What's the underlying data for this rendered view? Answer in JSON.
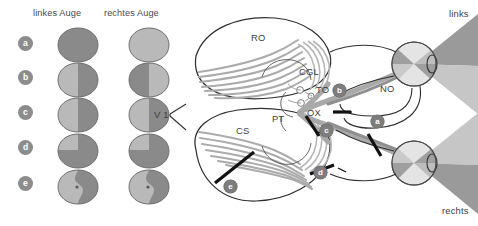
{
  "figure": {
    "side_labels": {
      "top": "links",
      "bottom": "rechts"
    }
  },
  "fields_panel": {
    "headers": {
      "left_eye": "linkes Auge",
      "right_eye": "rechtes Auge"
    },
    "rows": [
      {
        "id": "a",
        "label": "a",
        "left": "full-dark",
        "right": "full-light"
      },
      {
        "id": "b",
        "label": "b",
        "left": "temporal-dark-right",
        "right": "temporal-dark-left"
      },
      {
        "id": "c",
        "label": "c",
        "left": "right-half-dark",
        "right": "right-half-dark"
      },
      {
        "id": "d",
        "label": "d",
        "left": "upper-left-light-rest-dark",
        "right": "upper-left-light-rest-dark"
      },
      {
        "id": "e",
        "label": "e",
        "left": "right-half-dark-macula-spared",
        "right": "right-half-dark-macula-spared"
      }
    ]
  },
  "anatomy_labels": [
    {
      "key": "RO",
      "text": "RO",
      "meaning": "Radiatio optica"
    },
    {
      "key": "CGL",
      "text": "CGL",
      "meaning": "Corpus geniculatum laterale"
    },
    {
      "key": "TO",
      "text": "TO",
      "meaning": "Tractus opticus"
    },
    {
      "key": "PT",
      "text": "PT",
      "meaning": "Pratektum"
    },
    {
      "key": "OX",
      "text": "OX",
      "meaning": "Chiasma opticum"
    },
    {
      "key": "NO",
      "text": "NO",
      "meaning": "Nervus opticus"
    },
    {
      "key": "CS",
      "text": "CS",
      "meaning": "Colliculus superior"
    },
    {
      "key": "V1",
      "text": "V 1",
      "meaning": "primaere Sehrinde"
    }
  ],
  "lesions": [
    {
      "id": "a",
      "label": "a",
      "site": "nervus-opticus-right"
    },
    {
      "id": "b",
      "label": "b",
      "site": "chiasma-opticum"
    },
    {
      "id": "c",
      "label": "c",
      "site": "tractus-opticus-left"
    },
    {
      "id": "d",
      "label": "d",
      "site": "radiatio-optica-anterior"
    },
    {
      "id": "e",
      "label": "e",
      "site": "radiatio-optica-occipital"
    }
  ],
  "colors": {
    "field_dark": "#8a8a8a",
    "field_light": "#b9b9b9",
    "outline": "#6f6f6f",
    "marker_bg": "#8c8c8c",
    "pathway": "#a9a9a9",
    "pathway_dark": "#8f8f8f",
    "cone_dark": "#9a9a9a",
    "cone_light": "#c6c6c6",
    "ink": "#3d3d3d"
  }
}
